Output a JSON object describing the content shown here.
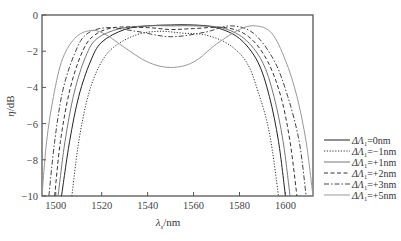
{
  "chart_data": {
    "type": "line",
    "title": "",
    "xlabel": "λs/nm",
    "xlabel_main": "λ",
    "xlabel_sub": "s",
    "xlabel_unit": "/nm",
    "ylabel": "η/dB",
    "ylabel_main": "η",
    "ylabel_unit": "/dB",
    "xlim": [
      1494,
      1612
    ],
    "ylim": [
      -10,
      0
    ],
    "xticks": [
      1500,
      1520,
      1540,
      1560,
      1580,
      1600
    ],
    "yticks": [
      0,
      -2,
      -4,
      -6,
      -8,
      -10
    ],
    "ytick_labels": [
      "0",
      "−2",
      "−4",
      "−6",
      "−8",
      "−10"
    ],
    "grid": false,
    "legend_position": "right, outside plot, lower",
    "series": [
      {
        "name": "ΔΛ1=0nm",
        "delta": "=0nm",
        "style": "solid",
        "color": "#222222",
        "points": [
          [
            1502.5,
            -10
          ],
          [
            1506,
            -7
          ],
          [
            1510,
            -4.5
          ],
          [
            1515,
            -2.6
          ],
          [
            1520,
            -1.5
          ],
          [
            1530,
            -0.8
          ],
          [
            1540,
            -0.6
          ],
          [
            1550,
            -0.55
          ],
          [
            1560,
            -0.55
          ],
          [
            1570,
            -0.7
          ],
          [
            1580,
            -1.3
          ],
          [
            1588,
            -2.6
          ],
          [
            1593,
            -4.5
          ],
          [
            1597,
            -7
          ],
          [
            1600,
            -10
          ]
        ]
      },
      {
        "name": "ΔΛ1=−1nm",
        "delta": "=−1nm",
        "style": "dotted",
        "color": "#333333",
        "points": [
          [
            1507,
            -10
          ],
          [
            1510,
            -7
          ],
          [
            1514,
            -4.5
          ],
          [
            1519,
            -2.8
          ],
          [
            1525,
            -1.8
          ],
          [
            1535,
            -1.1
          ],
          [
            1545,
            -0.9
          ],
          [
            1555,
            -1.0
          ],
          [
            1565,
            -1.1
          ],
          [
            1575,
            -1.6
          ],
          [
            1583,
            -2.6
          ],
          [
            1588,
            -4.2
          ],
          [
            1593,
            -6.5
          ],
          [
            1597,
            -10
          ]
        ]
      },
      {
        "name": "ΔΛ1=+1nm",
        "delta": "=+1nm",
        "style": "solid",
        "color": "#777777",
        "points": [
          [
            1501,
            -10
          ],
          [
            1504,
            -7
          ],
          [
            1508,
            -4.3
          ],
          [
            1513,
            -2.3
          ],
          [
            1518,
            -1.3
          ],
          [
            1528,
            -0.75
          ],
          [
            1540,
            -0.6
          ],
          [
            1550,
            -0.6
          ],
          [
            1560,
            -0.6
          ],
          [
            1572,
            -0.7
          ],
          [
            1582,
            -1.3
          ],
          [
            1590,
            -2.6
          ],
          [
            1595,
            -4.5
          ],
          [
            1599,
            -7
          ],
          [
            1602,
            -10
          ]
        ]
      },
      {
        "name": "ΔΛ1=+2nm",
        "delta": "=+2nm",
        "style": "dashed",
        "color": "#333333",
        "points": [
          [
            1499.5,
            -10
          ],
          [
            1502,
            -7
          ],
          [
            1506,
            -4.2
          ],
          [
            1511,
            -2.2
          ],
          [
            1516,
            -1.2
          ],
          [
            1525,
            -0.7
          ],
          [
            1540,
            -0.7
          ],
          [
            1550,
            -0.8
          ],
          [
            1560,
            -0.75
          ],
          [
            1574,
            -0.7
          ],
          [
            1584,
            -1.2
          ],
          [
            1592,
            -2.5
          ],
          [
            1598,
            -4.5
          ],
          [
            1602,
            -7
          ],
          [
            1605,
            -10
          ]
        ]
      },
      {
        "name": "ΔΛ1=+3nm",
        "delta": "=+3nm",
        "style": "dash-dot",
        "color": "#444444",
        "points": [
          [
            1497,
            -10
          ],
          [
            1499.5,
            -7
          ],
          [
            1503,
            -4.2
          ],
          [
            1508,
            -2.2
          ],
          [
            1513,
            -1.1
          ],
          [
            1522,
            -0.7
          ],
          [
            1535,
            -0.9
          ],
          [
            1550,
            -1.2
          ],
          [
            1565,
            -0.95
          ],
          [
            1576,
            -0.6
          ],
          [
            1586,
            -1.0
          ],
          [
            1595,
            -2.5
          ],
          [
            1601,
            -4.5
          ],
          [
            1606,
            -7
          ],
          [
            1609,
            -10
          ]
        ]
      },
      {
        "name": "ΔΛ1=+5nm",
        "delta": "=+5nm",
        "style": "solid",
        "color": "#999999",
        "points": [
          [
            1494,
            -10
          ],
          [
            1496,
            -7
          ],
          [
            1499,
            -4.5
          ],
          [
            1503,
            -2.4
          ],
          [
            1509,
            -1.2
          ],
          [
            1516,
            -0.85
          ],
          [
            1522,
            -1.1
          ],
          [
            1530,
            -1.8
          ],
          [
            1540,
            -2.6
          ],
          [
            1550,
            -2.9
          ],
          [
            1560,
            -2.6
          ],
          [
            1570,
            -1.6
          ],
          [
            1580,
            -0.8
          ],
          [
            1587,
            -0.6
          ],
          [
            1594,
            -1.0
          ],
          [
            1600,
            -2.5
          ],
          [
            1605,
            -4.5
          ],
          [
            1609,
            -7
          ],
          [
            1612,
            -10
          ]
        ]
      }
    ]
  },
  "legend": {
    "prefix": "ΔΛ",
    "sub": "1"
  }
}
